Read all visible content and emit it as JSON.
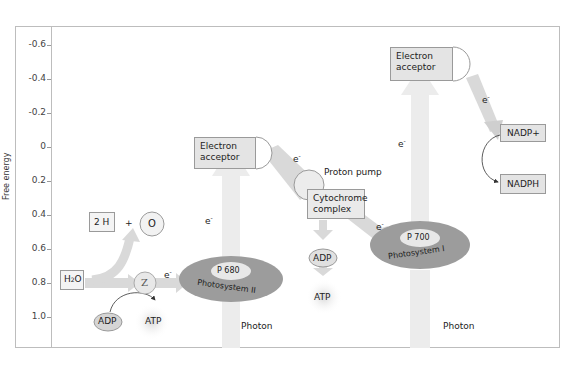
{
  "axis": {
    "ylabel": "Free energy",
    "ticks": [
      "-0.6",
      "-0.4",
      "-0.2",
      "0",
      "0.2",
      "0.4",
      "0.6",
      "0.8",
      "1.0"
    ]
  },
  "nodes": {
    "h2o": "H2O",
    "two_h": "2 H",
    "plus": "+",
    "oxygen": "O",
    "z": "Z",
    "adp_left": "ADP",
    "atp_left": "ATP",
    "ps2_center": "P 680",
    "ps2_label": "Photosystem II",
    "photon_left": "Photon",
    "acceptor_1_line1": "Electron",
    "acceptor_1_line2": "acceptor",
    "proton_pump": "Proton pump",
    "cytochrome_line1": "Cytochrome",
    "cytochrome_line2": "complex",
    "adp_mid": "ADP",
    "atp_mid": "ATP",
    "ps1_center": "P 700",
    "ps1_label": "Photosystem I",
    "photon_right": "Photon",
    "acceptor_2_line1": "Electron",
    "acceptor_2_line2": "acceptor",
    "nadp_plus": "NADP+",
    "nadph": "NADPH",
    "electron": "e"
  },
  "colors": {
    "frame": "#bdbdbd",
    "box_fill": "#e4e4e4",
    "photosystem_fill": "#9c9c9c",
    "arrow_fill": "#d9d9d9",
    "photon_beam": "#ececec"
  }
}
